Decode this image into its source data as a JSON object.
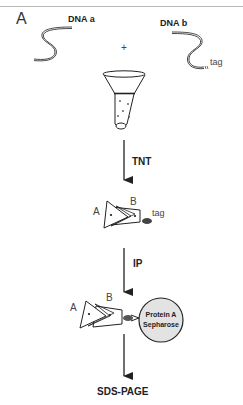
{
  "figure": {
    "panel_label": "A",
    "dna": [
      {
        "label": "DNA a"
      },
      {
        "label": "DNA b",
        "tag_label": "tag"
      }
    ],
    "plus_sign": "+",
    "steps": [
      {
        "label": "TNT"
      },
      {
        "label": "IP"
      }
    ],
    "complex": {
      "subunit_a": "A",
      "subunit_b": "B",
      "tag_label": "tag"
    },
    "bead": {
      "line1": "Protein A",
      "line2": "Sepharose"
    },
    "final_step": "SDS-PAGE"
  }
}
